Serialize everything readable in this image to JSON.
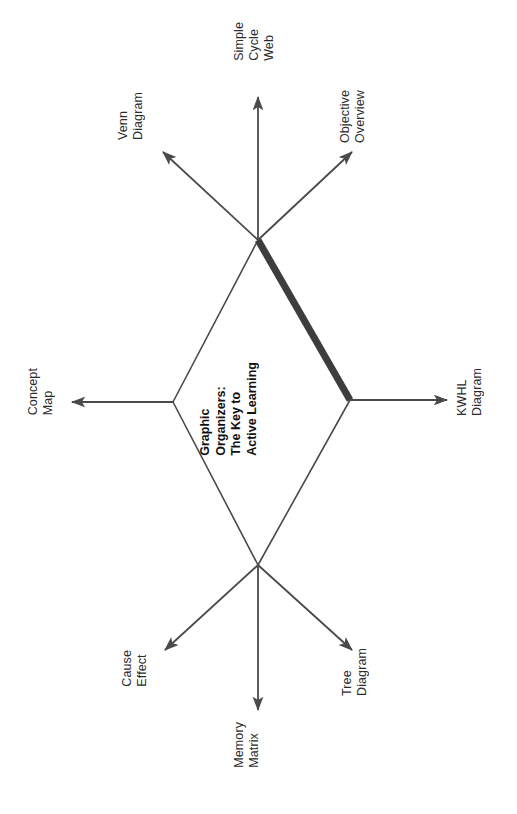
{
  "diagram": {
    "title_lines": [
      "Graphic",
      "Organizers:",
      "The Key to",
      "Active Learning"
    ],
    "title_text": "Graphic Organizers: The Key to Active Learning",
    "orientation": "rotated-90-ccw",
    "colors": {
      "line": "#4a4a4a",
      "emphasis_line": "#3d3d3d",
      "text": "#2b2b2b",
      "title_text": "#111111",
      "background": "#ffffff"
    },
    "nodes": [
      {
        "id": "top-junction",
        "x": 258,
        "y": 240
      },
      {
        "id": "left-junction",
        "x": 173,
        "y": 402
      },
      {
        "id": "right-junction",
        "x": 350,
        "y": 400
      },
      {
        "id": "bottom-junction",
        "x": 258,
        "y": 565
      }
    ],
    "branches": [
      {
        "id": "simple-cycle-web",
        "lines": [
          "Simple",
          "Cycle",
          "Web"
        ],
        "text": "Simple Cycle Web",
        "from": "top-junction",
        "tip_x": 258,
        "tip_y": 97,
        "label_x": 232,
        "label_y": 22,
        "emphasis": false
      },
      {
        "id": "venn-diagram",
        "lines": [
          "Venn",
          "Diagram"
        ],
        "text": "Venn Diagram",
        "from": "top-junction",
        "tip_x": 163,
        "tip_y": 152,
        "label_x": 116,
        "label_y": 92,
        "emphasis": false
      },
      {
        "id": "objective-overview",
        "lines": [
          "Objective",
          "Overview"
        ],
        "text": "Objective Overview",
        "from": "top-junction",
        "tip_x": 352,
        "tip_y": 152,
        "label_x": 338,
        "label_y": 90,
        "emphasis": false
      },
      {
        "id": "concept-map",
        "lines": [
          "Concept",
          "Map"
        ],
        "text": "Concept Map",
        "from": "left-junction",
        "tip_x": 72,
        "tip_y": 402,
        "label_x": 26,
        "label_y": 368,
        "emphasis": false
      },
      {
        "id": "kwhl-diagram",
        "lines": [
          "KWHL",
          "Diagram"
        ],
        "text": "KWHL Diagram",
        "from": "right-junction",
        "tip_x": 447,
        "tip_y": 400,
        "label_x": 455,
        "label_y": 368,
        "emphasis": false
      },
      {
        "id": "cause-effect",
        "lines": [
          "Cause",
          "Effect"
        ],
        "text": "Cause Effect",
        "from": "bottom-junction",
        "tip_x": 165,
        "tip_y": 650,
        "label_x": 120,
        "label_y": 650,
        "emphasis": false
      },
      {
        "id": "memory-matrix",
        "lines": [
          "Memory",
          "Matrix"
        ],
        "text": "Memory Matrix",
        "from": "bottom-junction",
        "tip_x": 258,
        "tip_y": 710,
        "label_x": 232,
        "label_y": 722,
        "emphasis": false
      },
      {
        "id": "tree-diagram",
        "lines": [
          "Tree",
          "Diagram"
        ],
        "text": "Tree Diagram",
        "from": "bottom-junction",
        "tip_x": 352,
        "tip_y": 650,
        "label_x": 340,
        "label_y": 648,
        "emphasis": false
      }
    ],
    "connectors": [
      {
        "id": "top-to-left",
        "from": "top-junction",
        "to": "left-junction",
        "emphasis": false
      },
      {
        "id": "top-to-right",
        "from": "top-junction",
        "to": "right-junction",
        "emphasis": true
      },
      {
        "id": "left-to-bottom",
        "from": "left-junction",
        "to": "bottom-junction",
        "emphasis": false
      },
      {
        "id": "right-to-bottom",
        "from": "right-junction",
        "to": "bottom-junction",
        "emphasis": false
      }
    ]
  }
}
